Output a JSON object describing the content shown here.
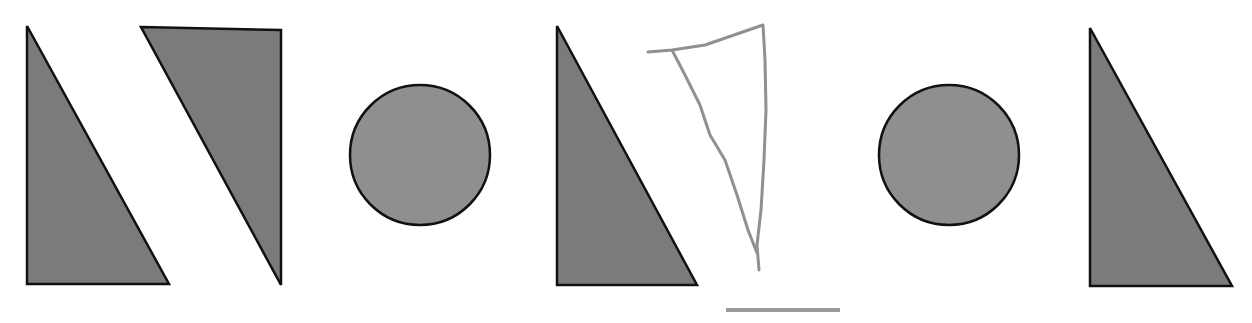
{
  "canvas": {
    "width": 1252,
    "height": 323,
    "background": "#ffffff"
  },
  "colors": {
    "triangle_fill": "#7b7b7b",
    "circle_fill": "#8f8f8f",
    "outline": "#111111",
    "sketch_stroke": "#909090",
    "answer_line": "#9a9a9a"
  },
  "sequence": [
    {
      "index": 1,
      "shape": "right-triangle",
      "orientation": "right-angle-bottom-left",
      "points": "27,26 27,284 169,284"
    },
    {
      "index": 2,
      "shape": "right-triangle",
      "orientation": "right-angle-top-right",
      "points": "141,27 281,30 281,285"
    },
    {
      "index": 3,
      "shape": "circle",
      "cx": 420,
      "cy": 155,
      "r": 70
    },
    {
      "index": 4,
      "shape": "right-triangle",
      "orientation": "right-angle-bottom-left",
      "points": "557,26 557,285 697,285"
    },
    {
      "index": 5,
      "shape": "hand-drawn-triangle",
      "orientation": "inverted",
      "path": "M648,52 L672,50 L705,45 L763,25 L765,60 L766,110 L764,160 L761,210 L757,245 L759,270 M672,50 L685,75 L700,105 L710,135 L725,160 L737,195 L748,230 L757,253"
    },
    {
      "index": 6,
      "shape": "circle",
      "cx": 949,
      "cy": 155,
      "r": 70
    },
    {
      "index": 7,
      "shape": "right-triangle",
      "orientation": "right-angle-bottom-left",
      "points": "1090,28 1090,286 1232,286"
    }
  ],
  "answer_line": {
    "x1": 726,
    "y1": 310,
    "x2": 840,
    "y2": 310
  }
}
